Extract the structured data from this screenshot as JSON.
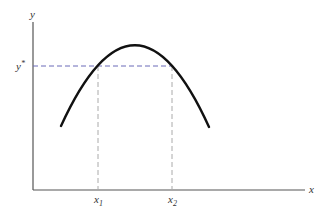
{
  "diagram": {
    "axes": {
      "y_label": "y",
      "x_label": "x",
      "color": "#555555"
    },
    "curve": {
      "shape": "inverted-parabola",
      "color": "#111111"
    },
    "guides": {
      "y_star_label": "y*",
      "y_star_base": "y",
      "y_star_sup": "*",
      "x1_base": "x",
      "x1_sub": "1",
      "x2_base": "x",
      "x2_sub": "2",
      "horizontal_color": "#6b6bb8",
      "vertical_color": "#aaaaaa"
    }
  }
}
